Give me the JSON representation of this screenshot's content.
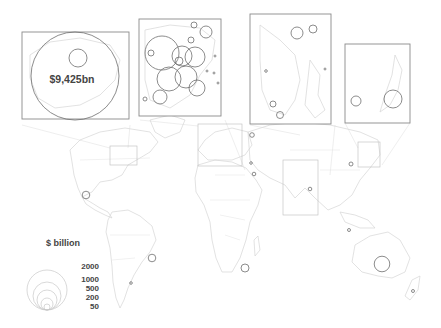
{
  "map": {
    "title": "",
    "type": "proportional-symbol world map",
    "highlight_label": "$9,425bn",
    "insets": [
      {
        "name": "north-america-northeast",
        "label": ""
      },
      {
        "name": "europe",
        "label": ""
      },
      {
        "name": "east-asia",
        "label": ""
      },
      {
        "name": "japan",
        "label": ""
      }
    ]
  },
  "legend": {
    "title": "$ billion",
    "values": [
      "2000",
      "1000",
      "500",
      "200",
      "50"
    ]
  },
  "colors": {
    "bubble_stroke": "#6e6e6e",
    "land_stroke": "#d6d6d6",
    "inset_border": "#8a8a8a",
    "text": "#444444"
  }
}
